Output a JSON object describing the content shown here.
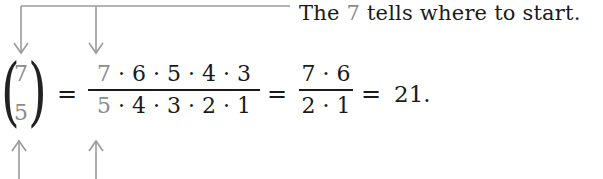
{
  "annotations": {
    "top_caption": {
      "prefix": "The",
      "highlight": "7",
      "suffix": "tells where to start."
    }
  },
  "equation": {
    "binomial": {
      "top": "7",
      "bottom": "5"
    },
    "equals_1": "=",
    "fraction_1": {
      "numerator_highlight": "7",
      "numerator_rest": "· 6 · 5 · 4 · 3",
      "denominator_highlight": "5",
      "denominator_rest": "· 4 · 3 · 2 · 1"
    },
    "equals_2": "=",
    "fraction_2": {
      "numerator": "7 · 6",
      "denominator": "2 · 1"
    },
    "equals_3": "=",
    "result": "21."
  },
  "colors": {
    "highlight": "#8c8c8c",
    "arrow": "#9a9a9a",
    "text": "#1a1a1a"
  }
}
